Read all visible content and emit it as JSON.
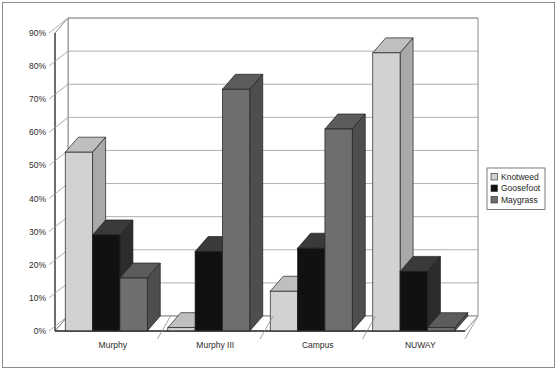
{
  "chart_data": {
    "type": "bar",
    "title": "",
    "subtitle": "",
    "xlabel": "",
    "ylabel": "",
    "categories": [
      "Murphy",
      "Murphy III",
      "Campus",
      "NUWAY"
    ],
    "series": [
      {
        "name": "Knotweed",
        "values": [
          54,
          1,
          12,
          84
        ],
        "color": "#d2d2d2"
      },
      {
        "name": "Goosefoot",
        "values": [
          29,
          24,
          25,
          18
        ],
        "color": "#111111"
      },
      {
        "name": "Maygrass",
        "values": [
          16,
          73,
          61,
          1
        ],
        "color": "#6e6e6e"
      }
    ],
    "ylim": [
      0,
      90
    ],
    "y_tick_step": 10,
    "y_ticks": [
      "0%",
      "10%",
      "20%",
      "30%",
      "40%",
      "50%",
      "60%",
      "70%",
      "80%",
      "90%"
    ],
    "grid": true,
    "grid_axis": "y",
    "legend_position": "right",
    "three_d": true,
    "value_format": "percent"
  },
  "legend": {
    "entries": [
      {
        "label": "Knotweed",
        "swatch": "#d2d2d2"
      },
      {
        "label": "Goosefoot",
        "swatch": "#111111"
      },
      {
        "label": "Maygrass",
        "swatch": "#6e6e6e"
      }
    ]
  },
  "style": {
    "plot_background": "#ffffff",
    "axis_line": "#333333",
    "grid_line": "#9a9a9a",
    "frame_border": "#8c8c8c",
    "wall_fill": "#ffffff",
    "floor_fill": "#ffffff",
    "series_side_colors": [
      "#a9a9a9",
      "#2c2c2c",
      "#4e4e4e"
    ],
    "series_top_colors": [
      "#bfbfbf",
      "#3a3a3a",
      "#5c5c5c"
    ]
  }
}
